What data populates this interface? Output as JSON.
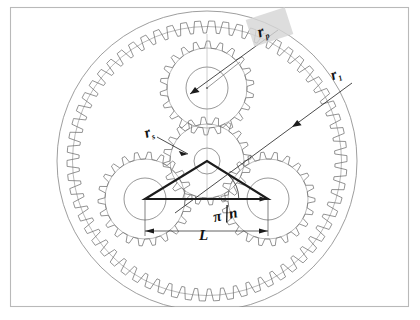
{
  "figure": {
    "background_color": "#ffffff",
    "frame_color": "#b9b9b9"
  },
  "labels": {
    "ring_radius": {
      "symbol": "r",
      "subscript": "p",
      "text": "rp",
      "highlighted": true,
      "highlight_color": "#d6d6d6"
    },
    "planet_radius": {
      "symbol": "r",
      "subscript": "1",
      "text": "r1",
      "highlighted": false
    },
    "sun_radius": {
      "symbol": "r",
      "subscript": "s",
      "text": "rs",
      "highlighted": false
    },
    "spacing": {
      "symbol": "L",
      "text": "L",
      "highlighted": false
    },
    "angle": {
      "numerator": "π",
      "denominator": "n",
      "text": "π/n",
      "highlighted": false
    }
  },
  "geometry": {
    "ring_outer_center": [
      207,
      161
    ],
    "ring_outer_radius": 150,
    "ring_teeth_radius": 134,
    "sun_center": [
      207,
      161
    ],
    "sun_teeth_radius": 44,
    "sun_hub_radius": 13,
    "planets": [
      {
        "name": "planet-top",
        "center": [
          207,
          88
        ],
        "teeth_radius": 47,
        "hub_radius": 21
      },
      {
        "name": "planet-left",
        "center": [
          145,
          199
        ],
        "teeth_radius": 47,
        "hub_radius": 21
      },
      {
        "name": "planet-right",
        "center": [
          268,
          199
        ],
        "teeth_radius": 47,
        "hub_radius": 21
      }
    ],
    "triangle_vertices": [
      [
        207,
        161
      ],
      [
        145,
        199
      ],
      [
        268,
        199
      ]
    ],
    "tooth_counts": {
      "ring": 62,
      "sun": 20,
      "planet": 22
    }
  },
  "colors": {
    "gear_stroke": "#6f6f6f",
    "ring_stroke": "#8d8d8d",
    "triangle_stroke": "#1c1c1c",
    "label_fill": "#111111",
    "highlight": "#d6d6d6"
  }
}
